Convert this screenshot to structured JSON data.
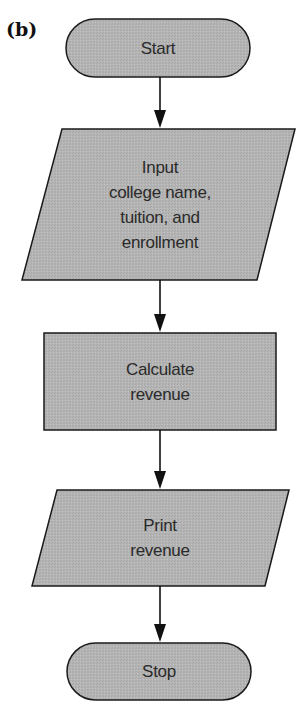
{
  "figure": {
    "panel_label": "(b)",
    "colors": {
      "shape_fill": "#b4b4b4",
      "shape_stroke": "#1a1a1a",
      "arrow": "#111111",
      "background": "#ffffff"
    }
  },
  "nodes": [
    {
      "id": "start",
      "type": "terminal",
      "lines": [
        "Start"
      ]
    },
    {
      "id": "input",
      "type": "input-output",
      "lines": [
        "Input",
        "college name,",
        "tuition, and",
        "enrollment"
      ]
    },
    {
      "id": "calculate",
      "type": "process",
      "lines": [
        "Calculate",
        "revenue"
      ]
    },
    {
      "id": "print",
      "type": "input-output",
      "lines": [
        "Print",
        "revenue"
      ]
    },
    {
      "id": "stop",
      "type": "terminal",
      "lines": [
        "Stop"
      ]
    }
  ],
  "edges": [
    {
      "from": "start",
      "to": "input"
    },
    {
      "from": "input",
      "to": "calculate"
    },
    {
      "from": "calculate",
      "to": "print"
    },
    {
      "from": "print",
      "to": "stop"
    }
  ]
}
